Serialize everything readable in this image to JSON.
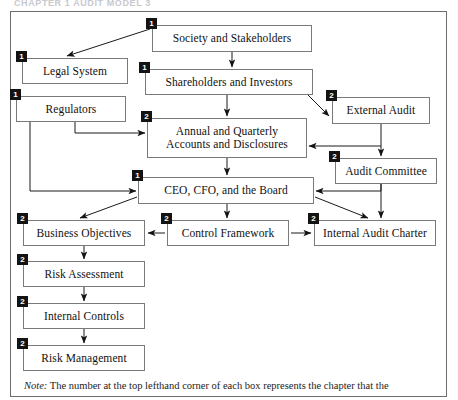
{
  "page": {
    "running_header": "CHAPTER 1    AUDIT MODEL 3"
  },
  "figure": {
    "note_lead": "Note:",
    "note_text": " The number at the top lefthand corner of each box represents the chapter that the"
  },
  "diagram": {
    "type": "flowchart",
    "badge_colors": {
      "fill": "#131313",
      "text": "#ffffff"
    },
    "line_color": "#1a1a1a",
    "box_border": "#7a7a7a",
    "nodes": [
      {
        "id": "society",
        "label": "Society and Stakeholders",
        "badge": "1",
        "x": 152,
        "y": 25,
        "w": 160,
        "h": 27
      },
      {
        "id": "legal",
        "label": "Legal System",
        "badge": "1",
        "x": 22,
        "y": 58,
        "w": 106,
        "h": 26
      },
      {
        "id": "shareholders",
        "label": "Shareholders and Investors",
        "badge": "1",
        "x": 145,
        "y": 69,
        "w": 168,
        "h": 26
      },
      {
        "id": "regulators",
        "label": "Regulators",
        "badge": "1",
        "x": 16,
        "y": 96,
        "w": 110,
        "h": 26
      },
      {
        "id": "external-audit",
        "label": "External Audit",
        "badge": "2",
        "x": 332,
        "y": 97,
        "w": 98,
        "h": 27
      },
      {
        "id": "annual-accounts",
        "label": "Annual and Quarterly\nAccounts and Disclosures",
        "badge": "2",
        "x": 147,
        "y": 118,
        "w": 160,
        "h": 40
      },
      {
        "id": "audit-committee",
        "label": "Audit Committee",
        "badge": "2",
        "x": 335,
        "y": 158,
        "w": 102,
        "h": 26
      },
      {
        "id": "ceo-cfo-board",
        "label": "CEO, CFO, and the Board",
        "badge": "1",
        "x": 138,
        "y": 177,
        "w": 176,
        "h": 27
      },
      {
        "id": "business-objectives",
        "label": "Business Objectives",
        "badge": "2",
        "x": 23,
        "y": 220,
        "w": 122,
        "h": 26
      },
      {
        "id": "control-framework",
        "label": "Control Framework",
        "badge": "2",
        "x": 167,
        "y": 220,
        "w": 122,
        "h": 26
      },
      {
        "id": "internal-audit-charter",
        "label": "Internal Audit Charter",
        "badge": "2",
        "x": 314,
        "y": 220,
        "w": 122,
        "h": 26
      },
      {
        "id": "risk-assessment",
        "label": "Risk Assessment",
        "badge": "2",
        "x": 23,
        "y": 261,
        "w": 122,
        "h": 26
      },
      {
        "id": "internal-controls",
        "label": "Internal Controls",
        "badge": "2",
        "x": 23,
        "y": 303,
        "w": 122,
        "h": 26
      },
      {
        "id": "risk-management",
        "label": "Risk Management",
        "badge": "2",
        "x": 23,
        "y": 345,
        "w": 122,
        "h": 26
      }
    ],
    "edges": [
      {
        "from": "society",
        "to": "legal"
      },
      {
        "from": "society",
        "to": "shareholders"
      },
      {
        "from": "shareholders",
        "to": "annual-accounts"
      },
      {
        "from": "shareholders",
        "to": "external-audit"
      },
      {
        "from": "regulators",
        "to": "annual-accounts"
      },
      {
        "from": "regulators",
        "to": "ceo-cfo-board"
      },
      {
        "from": "external-audit",
        "to": "annual-accounts"
      },
      {
        "from": "external-audit",
        "to": "audit-committee"
      },
      {
        "from": "annual-accounts",
        "to": "ceo-cfo-board"
      },
      {
        "from": "audit-committee",
        "to": "ceo-cfo-board"
      },
      {
        "from": "audit-committee",
        "to": "internal-audit-charter"
      },
      {
        "from": "ceo-cfo-board",
        "to": "control-framework"
      },
      {
        "from": "ceo-cfo-board",
        "to": "business-objectives"
      },
      {
        "from": "ceo-cfo-board",
        "to": "internal-audit-charter"
      },
      {
        "from": "control-framework",
        "to": "business-objectives"
      },
      {
        "from": "control-framework",
        "to": "internal-audit-charter"
      },
      {
        "from": "business-objectives",
        "to": "risk-assessment"
      },
      {
        "from": "risk-assessment",
        "to": "internal-controls"
      },
      {
        "from": "internal-controls",
        "to": "risk-management"
      }
    ]
  }
}
